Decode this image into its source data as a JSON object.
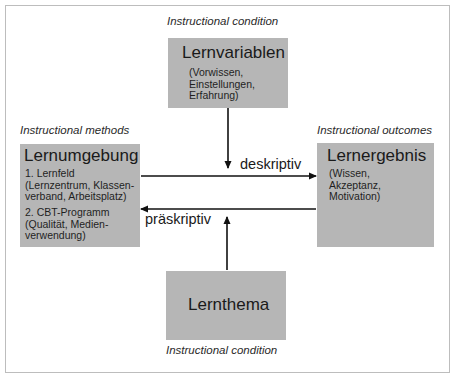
{
  "diagram": {
    "nodes": [
      {
        "id": "lernvariablen",
        "caption": "Instructional condition",
        "title": "Lernvariablen",
        "details": "(Vorwissen,\nEinstellungen,\nErfahrung)"
      },
      {
        "id": "lernumgebung",
        "caption": "Instructional methods",
        "title": "Lernumgebung",
        "item1": "1. Lernfeld\n(Lernzentrum, Klassen-\nverband, Arbeitsplatz)",
        "item2": "2. CBT-Programm\n(Qualität, Medien-\nverwendung)"
      },
      {
        "id": "lernergebnis",
        "caption": "Instructional outcomes",
        "title": "Lernergebnis",
        "details": "(Wissen,\nAkzeptanz,\nMotivation)"
      },
      {
        "id": "lernthema",
        "caption": "Instructional condition",
        "title": "Lernthema"
      }
    ],
    "edges": [
      {
        "from": "lernumgebung",
        "to": "lernergebnis",
        "label": "deskriptiv"
      },
      {
        "from": "lernergebnis",
        "to": "lernumgebung",
        "label": "präskriptiv"
      },
      {
        "from": "lernvariablen",
        "to": "deskriptiv-line",
        "label": ""
      },
      {
        "from": "lernthema",
        "to": "präskriptiv-line",
        "label": ""
      }
    ],
    "colors": {
      "box_fill": "#b6b6b6",
      "frame": "#bdbdbd",
      "arrow": "#111111"
    }
  }
}
